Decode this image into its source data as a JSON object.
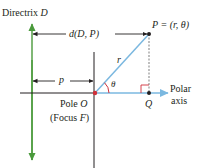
{
  "labels": {
    "directrix": "Directrix ",
    "directrix_var": "D",
    "distance": "d(D, P)",
    "point": "P = (r, θ)",
    "r": "r",
    "theta": "θ",
    "p": "p",
    "q": "Q",
    "pole": "Pole ",
    "pole_var": "O",
    "focus": "(Focus ",
    "focus_var": "F",
    "focus_close": ")",
    "polar": "Polar",
    "axis": "axis"
  },
  "colors": {
    "directrix": "#4a9a3c",
    "ray": "#7bb8e0",
    "angle": "#d0303a",
    "pole": "#d0303a",
    "ink": "#231f20"
  },
  "geometry": {
    "pole": [
      95,
      93
    ],
    "point_P": [
      149,
      33
    ],
    "point_Q": [
      149,
      93
    ],
    "directrix_x": 32
  }
}
